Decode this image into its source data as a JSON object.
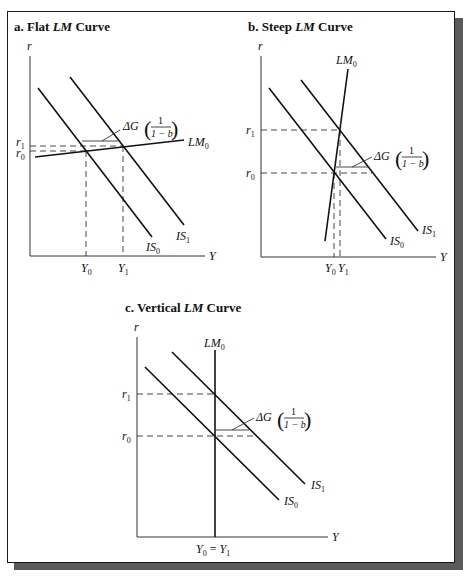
{
  "panels": [
    {
      "id": "a",
      "title_prefix": "a.  Flat ",
      "title_italic": "LM",
      "title_suffix": " Curve",
      "y_axis_label": "r",
      "x_axis_label": "Y",
      "lm_label": "LM",
      "lm_sub": "0",
      "is0_label": "IS",
      "is0_sub": "0",
      "is1_label": "IS",
      "is1_sub": "1",
      "r1_label": "r",
      "r1_sub": "1",
      "r0_label": "r",
      "r0_sub": "0",
      "y0_label": "Y",
      "y0_sub": "0",
      "y1_label": "Y",
      "y1_sub": "1",
      "annotation": {
        "delta": "ΔG",
        "num": "1",
        "den": "1 − b"
      }
    },
    {
      "id": "b",
      "title_prefix": "b.  Steep ",
      "title_italic": "LM",
      "title_suffix": " Curve",
      "y_axis_label": "r",
      "x_axis_label": "Y",
      "lm_label": "LM",
      "lm_sub": "0",
      "is0_label": "IS",
      "is0_sub": "0",
      "is1_label": "IS",
      "is1_sub": "1",
      "r1_label": "r",
      "r1_sub": "1",
      "r0_label": "r",
      "r0_sub": "0",
      "y0_label": "Y",
      "y0_sub": "0",
      "y1_label": "Y",
      "y1_sub": "1",
      "annotation": {
        "delta": "ΔG",
        "num": "1",
        "den": "1 − b"
      }
    },
    {
      "id": "c",
      "title_prefix": "c.  Vertical ",
      "title_italic": "LM",
      "title_suffix": " Curve",
      "y_axis_label": "r",
      "x_axis_label": "Y",
      "lm_label": "LM",
      "lm_sub": "0",
      "is0_label": "IS",
      "is0_sub": "0",
      "is1_label": "IS",
      "is1_sub": "1",
      "r1_label": "r",
      "r1_sub": "1",
      "r0_label": "r",
      "r0_sub": "0",
      "y_eq_label_a": "Y",
      "y_eq_sub_a": "0",
      "y_eq_mid": " = ",
      "y_eq_label_b": "Y",
      "y_eq_sub_b": "1",
      "annotation": {
        "delta": "ΔG",
        "num": "1",
        "den": "1 − b"
      }
    }
  ]
}
